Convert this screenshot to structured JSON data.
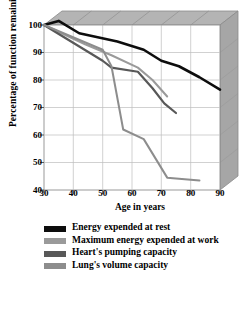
{
  "chart_data": {
    "type": "line",
    "title": "",
    "xlabel": "Age in years",
    "ylabel": "Percentage of function remaining",
    "xlim": [
      30,
      90
    ],
    "ylim": [
      40,
      100
    ],
    "xticks": [
      30,
      40,
      50,
      60,
      70,
      80,
      90
    ],
    "yticks": [
      40,
      50,
      60,
      70,
      80,
      90,
      100
    ],
    "grid": true,
    "legend_position": "below",
    "series": [
      {
        "name": "Energy expended at rest",
        "color": "#0d0d0d",
        "x": [
          30,
          35,
          42,
          55,
          64,
          70,
          76,
          83,
          90
        ],
        "values": [
          100,
          101.5,
          97,
          94,
          91,
          87,
          85,
          81,
          76.5
        ]
      },
      {
        "name": "Maximum energy expended at work",
        "color": "#9a9a9a",
        "x": [
          30,
          44,
          53,
          62,
          67,
          72
        ],
        "values": [
          100,
          93,
          89,
          84.5,
          80,
          74
        ]
      },
      {
        "name": "Heart's pumping capacity",
        "color": "#585858",
        "x": [
          30,
          50,
          53,
          62,
          67,
          71,
          75
        ],
        "values": [
          100,
          87,
          84.5,
          83,
          77,
          71.5,
          68
        ]
      },
      {
        "name": "Lung's volume capacity",
        "color": "#8d8d8d",
        "x": [
          30,
          50,
          53,
          57,
          64,
          72,
          83
        ],
        "values": [
          100,
          91,
          85,
          62,
          58.5,
          44.5,
          43.5
        ]
      }
    ]
  },
  "axis": {
    "xlabel": "Age in years",
    "ylabel": "Percentage of function remaining",
    "xticks": [
      "30",
      "40",
      "50",
      "60",
      "70",
      "80",
      "90"
    ],
    "yticks": [
      "100",
      "90",
      "80",
      "70",
      "60",
      "50",
      "40"
    ]
  },
  "legend": {
    "items": [
      {
        "label": "Energy expended at rest",
        "color": "#0d0d0d"
      },
      {
        "label": "Maximum energy expended at work",
        "color": "#9a9a9a"
      },
      {
        "label": "Heart's pumping capacity",
        "color": "#585858"
      },
      {
        "label": "Lung's volume capacity",
        "color": "#8d8d8d"
      }
    ]
  },
  "colors": {
    "box_top": "#b4b4b4",
    "box_right": "#a8a8a8",
    "box_edge": "#8f8f8f",
    "plot_bg": "#ffffff",
    "grid": "#b9b9b9",
    "axis": "#555555"
  }
}
